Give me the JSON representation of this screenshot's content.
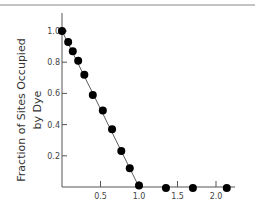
{
  "chart_data": {
    "type": "scatter",
    "title": "",
    "xlabel": "",
    "ylabel": "Fraction of Sites Occupied by Dye",
    "ylabel_lines": [
      "Fraction of Sites Occupied",
      "by Dye"
    ],
    "xlim": [
      0,
      2.2
    ],
    "ylim": [
      0,
      1.1
    ],
    "x_ticks": [
      0.5,
      1.0,
      1.5,
      2.0
    ],
    "x_tick_labels": [
      "0.5",
      "1.0",
      "1.5",
      "2.0"
    ],
    "y_ticks": [
      0.2,
      0.4,
      0.6,
      0.8,
      1.0
    ],
    "y_tick_labels": [
      "0.2",
      "0.4",
      "0.6",
      "0.8",
      "1.0"
    ],
    "grid": false,
    "legend": null,
    "series": [
      {
        "name": "data",
        "x": [
          0.0,
          0.08,
          0.14,
          0.21,
          0.29,
          0.4,
          0.53,
          0.65,
          0.77,
          0.88,
          1.0,
          1.35,
          1.7,
          2.14
        ],
        "y": [
          1.0,
          0.93,
          0.87,
          0.81,
          0.72,
          0.59,
          0.49,
          0.37,
          0.23,
          0.12,
          0.01,
          0.0,
          0.0,
          0.0
        ]
      }
    ],
    "fit_line": {
      "x": [
        0.0,
        1.0
      ],
      "y": [
        1.0,
        0.0
      ]
    },
    "colors": {
      "marker": "#000000",
      "line": "#333333",
      "axis": "#555555"
    }
  }
}
